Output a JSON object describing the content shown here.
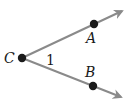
{
  "diagram": {
    "type": "angle",
    "vertex": {
      "label": "C",
      "x": 22,
      "y": 58,
      "label_x": 4,
      "label_y": 63
    },
    "points": [
      {
        "label": "A",
        "x": 94,
        "y": 24,
        "label_x": 86,
        "label_y": 43
      },
      {
        "label": "B",
        "x": 93,
        "y": 86,
        "label_x": 85,
        "label_y": 77
      }
    ],
    "rays": [
      {
        "name": "ray-CA",
        "from": "C",
        "through": "A",
        "tip_x": 123,
        "tip_y": 10
      },
      {
        "name": "ray-CB",
        "from": "C",
        "through": "B",
        "tip_x": 122,
        "tip_y": 98
      }
    ],
    "angle_label": {
      "text": "1",
      "x": 46,
      "y": 65
    },
    "colors": {
      "ray": "#8a8a8a",
      "point": "#1a1a1a",
      "text": "#1a1a1a",
      "background": "#ffffff"
    }
  }
}
